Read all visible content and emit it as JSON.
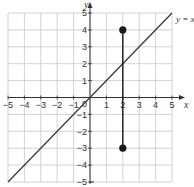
{
  "chart_data": {
    "type": "line",
    "title": "",
    "xlabel": "x",
    "ylabel": "y",
    "xlim": [
      -5,
      5
    ],
    "ylim": [
      -5,
      5
    ],
    "grid": true,
    "x_ticks": [
      "-5",
      "-4",
      "-3",
      "-2",
      "-1",
      "1",
      "2",
      "3",
      "4",
      "5"
    ],
    "y_ticks": [
      "5",
      "4",
      "3",
      "2",
      "1",
      "-1",
      "-2",
      "-3",
      "-4",
      "-5"
    ],
    "origin_label": "0",
    "series": [
      {
        "name": "y = x",
        "label": "y = x",
        "points": [
          [
            -5,
            -5
          ],
          [
            5,
            5
          ]
        ]
      },
      {
        "name": "vertical segment",
        "points": [
          [
            2,
            4
          ],
          [
            2,
            -3
          ]
        ],
        "endpoints_marked": true
      }
    ],
    "annotations": [
      {
        "text": "y = x",
        "position": "upper right, end of line"
      }
    ]
  },
  "colors": {
    "grid": "#c8c8c8",
    "axes": "#333333",
    "line": "#3a3a3a",
    "points": "#1a1a1a"
  }
}
